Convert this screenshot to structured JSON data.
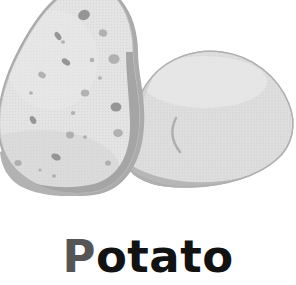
{
  "card": {
    "label": "Potato",
    "label_lead_letter": "P",
    "label_rest": "otato",
    "background_color": "#ffffff",
    "label_color": "#121212",
    "label_lead_color": "#555555"
  },
  "illustration": {
    "name": "two-potatoes-illustration",
    "alt_text": "Potato",
    "palette": {
      "flesh_fill": "#e2e2e2",
      "flesh_fill_shade": "#d6d6d6",
      "skin_fill": "#dcdcdc",
      "outline": "#a9a9a9",
      "rim_shadow": "#b4b4b4",
      "deep_shadow": "#9d9d9d",
      "eye_spot": "#a0a0a0",
      "eye_spot_dark": "#8d8d8d",
      "crease_line": "#b0b0b0"
    },
    "objects": [
      {
        "name": "cut-potato-half",
        "description": "teardrop shaped cut potato face with eye spots",
        "position": "left"
      },
      {
        "name": "whole-potato",
        "description": "rounded whole potato with a curved crease",
        "position": "right"
      }
    ],
    "eye_spots": [
      {
        "cx": 84,
        "cy": 15,
        "rx": 6.0,
        "ry": 5.0,
        "rot": -20,
        "tone": "dark"
      },
      {
        "cx": 103,
        "cy": 33,
        "rx": 4.2,
        "ry": 3.6,
        "rot": 10,
        "tone": "mid"
      },
      {
        "cx": 58,
        "cy": 36,
        "rx": 4.6,
        "ry": 2.6,
        "rot": 55,
        "tone": "dark"
      },
      {
        "cx": 114,
        "cy": 59,
        "rx": 5.6,
        "ry": 4.8,
        "rot": 0,
        "tone": "mid"
      },
      {
        "cx": 66,
        "cy": 62,
        "rx": 4.6,
        "ry": 2.8,
        "rot": 35,
        "tone": "dark"
      },
      {
        "cx": 92,
        "cy": 60,
        "rx": 2.4,
        "ry": 2.2,
        "rot": 0,
        "tone": "mid"
      },
      {
        "cx": 42,
        "cy": 75,
        "rx": 4.0,
        "ry": 3.0,
        "rot": 30,
        "tone": "mid"
      },
      {
        "cx": 63,
        "cy": 42,
        "rx": 2.0,
        "ry": 1.8,
        "rot": 0,
        "tone": "mid"
      },
      {
        "cx": 85,
        "cy": 93,
        "rx": 4.2,
        "ry": 3.6,
        "rot": 0,
        "tone": "mid"
      },
      {
        "cx": 116,
        "cy": 107,
        "rx": 5.4,
        "ry": 4.6,
        "rot": 0,
        "tone": "dark"
      },
      {
        "cx": 73,
        "cy": 113,
        "rx": 2.2,
        "ry": 2.0,
        "rot": 0,
        "tone": "mid"
      },
      {
        "cx": 33,
        "cy": 120,
        "rx": 4.2,
        "ry": 2.8,
        "rot": 60,
        "tone": "dark"
      },
      {
        "cx": 70,
        "cy": 135,
        "rx": 4.0,
        "ry": 3.4,
        "rot": 0,
        "tone": "mid"
      },
      {
        "cx": 118,
        "cy": 133,
        "rx": 4.8,
        "ry": 4.0,
        "rot": 0,
        "tone": "mid"
      },
      {
        "cx": 85,
        "cy": 137,
        "rx": 2.0,
        "ry": 1.8,
        "rot": 0,
        "tone": "mid"
      },
      {
        "cx": 56,
        "cy": 157,
        "rx": 5.0,
        "ry": 3.2,
        "rot": 25,
        "tone": "dark"
      },
      {
        "cx": 18,
        "cy": 163,
        "rx": 3.6,
        "ry": 3.0,
        "rot": 0,
        "tone": "mid"
      },
      {
        "cx": 40,
        "cy": 170,
        "rx": 1.6,
        "ry": 1.6,
        "rot": 0,
        "tone": "mid"
      },
      {
        "cx": 54,
        "cy": 176,
        "rx": 2.0,
        "ry": 1.8,
        "rot": 0,
        "tone": "mid"
      },
      {
        "cx": 108,
        "cy": 163,
        "rx": 3.0,
        "ry": 2.6,
        "rot": 0,
        "tone": "mid"
      },
      {
        "cx": 31,
        "cy": 93,
        "rx": 2.0,
        "ry": 1.8,
        "rot": 0,
        "tone": "mid"
      },
      {
        "cx": 100,
        "cy": 78,
        "rx": 2.0,
        "ry": 1.8,
        "rot": 0,
        "tone": "mid"
      }
    ]
  }
}
